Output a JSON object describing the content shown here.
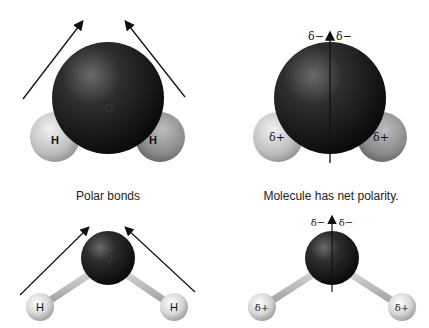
{
  "panels": {
    "top_left": {
      "oxygen_label": "O",
      "h_left_label": "H",
      "h_right_label": "H",
      "arrows": "bond-dipoles"
    },
    "top_right": {
      "delta_neg_left": "δ−",
      "delta_neg_right": "δ−",
      "delta_pos_left": "δ+",
      "delta_pos_right": "δ+",
      "arrows": "net-dipole"
    },
    "bottom_left": {
      "oxygen_label": "O",
      "h_left_label": "H",
      "h_right_label": "H"
    },
    "bottom_right": {
      "delta_neg_left": "δ−",
      "delta_neg_right": "δ−",
      "delta_pos_left": "δ+",
      "delta_pos_right": "δ+"
    }
  },
  "captions": {
    "left": "Polar bonds",
    "right": "Molecule has net polarity."
  },
  "colors": {
    "oxygen": "#141414",
    "hydrogen": "#d8d8d8",
    "bond": "#c8c8c8",
    "arrow": "#111111"
  }
}
